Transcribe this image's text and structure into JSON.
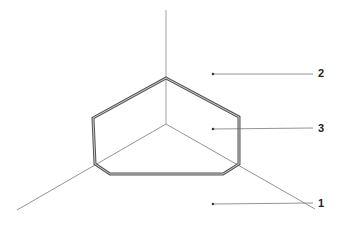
{
  "diagram": {
    "type": "isometric-corner-with-chamfered-panel",
    "colors": {
      "axis": "#888888",
      "panel_outer": "#555555",
      "panel_inner": "#bbbbbb",
      "leader": "#555555",
      "label": "#222222"
    },
    "labels": [
      {
        "id": "2",
        "text": "2",
        "dot": [
          213,
          74
        ],
        "end": [
          313,
          74
        ],
        "text_pos": [
          318,
          68
        ]
      },
      {
        "id": "3",
        "text": "3",
        "dot": [
          213,
          129
        ],
        "end": [
          313,
          128
        ],
        "text_pos": [
          318,
          123
        ]
      },
      {
        "id": "1",
        "text": "1",
        "dot": [
          213,
          204
        ],
        "end": [
          313,
          203
        ],
        "text_pos": [
          318,
          198
        ]
      }
    ]
  }
}
